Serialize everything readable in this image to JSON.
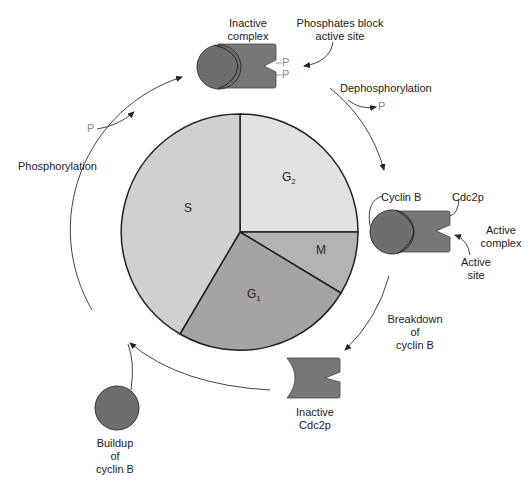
{
  "cycle_phases": [
    {
      "id": "g2",
      "label": "G",
      "sub": "2",
      "color": "#e2e2e2"
    },
    {
      "id": "m",
      "label": "M",
      "sub": "",
      "color": "#b3b3b3"
    },
    {
      "id": "g1",
      "label": "G",
      "sub": "1",
      "color": "#a4a4a4"
    },
    {
      "id": "s",
      "label": "S",
      "sub": "",
      "color": "#d0d0d0"
    }
  ],
  "labels": {
    "inactive_complex": [
      "Inactive",
      "complex"
    ],
    "phosphates_block": [
      "Phosphates block",
      "active site"
    ],
    "dephosphorylation": "Dephosphorylation",
    "phosphorylation": "Phosphorylation",
    "cyclin_b": "Cyclin B",
    "cdc2p": "Cdc2p",
    "active_complex": [
      "Active",
      "complex"
    ],
    "active_site": [
      "Active",
      "site"
    ],
    "breakdown": [
      "Breakdown",
      "of",
      "cyclin B"
    ],
    "inactive_cdc2p": [
      "Inactive",
      "Cdc2p"
    ],
    "buildup": [
      "Buildup",
      "of",
      "cyclin B"
    ],
    "phosphate": "P"
  },
  "colors": {
    "protein_dark": "#6e6e6e",
    "protein_mid": "#777777",
    "outline": "#222222",
    "phosphate": "#8a8a8a",
    "arrow": "#333333"
  }
}
